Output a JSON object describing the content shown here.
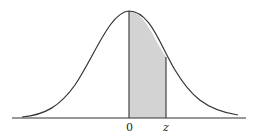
{
  "figure": {
    "type": "standard normal curve with shaded area",
    "labels": {
      "zero": "0",
      "z": "z"
    },
    "colors": {
      "curve": "#333333",
      "axis": "#333333",
      "shade": "#d3d3d3"
    },
    "shaded_region": {
      "from": "0",
      "to": "z"
    }
  }
}
